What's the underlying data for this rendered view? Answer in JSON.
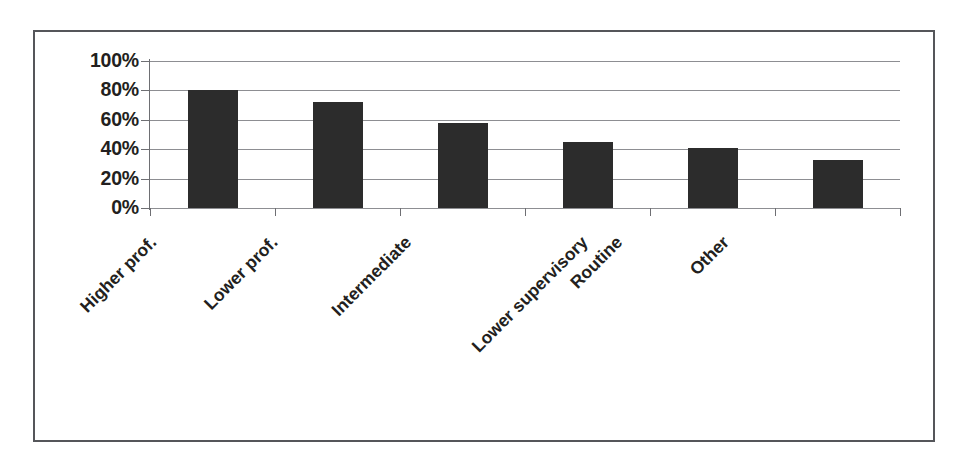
{
  "chart_data": {
    "type": "bar",
    "title": "",
    "subtitle": "",
    "xlabel": "",
    "ylabel": "",
    "categories": [
      "Higher prof.",
      "Lower prof.",
      "Intermediate",
      "Lower supervisory",
      "Routine",
      "Other"
    ],
    "values": [
      80,
      72,
      58,
      45,
      41,
      33
    ],
    "value_labels": [
      "80%",
      "72%",
      "58%",
      "45%",
      "41%",
      "33%"
    ],
    "ylim": [
      0,
      100
    ],
    "ytick_values": [
      0,
      20,
      40,
      60,
      80,
      100
    ],
    "ytick_labels": [
      "0%",
      "20%",
      "40%",
      "60%",
      "80%",
      "100%"
    ],
    "grid": true,
    "grid_axis": "y",
    "legend": false,
    "legend_position": "none",
    "xtick_label_rotation": -45,
    "series": [
      {
        "name": "",
        "values": [
          80,
          72,
          58,
          45,
          41,
          33
        ],
        "color": "#2c2c2c"
      }
    ],
    "colors": {
      "bar_fill": "#2c2c2c",
      "gridline": "#8d8e92",
      "axis_line": "#6e6f73",
      "frame_border": "#55565a",
      "text": "#231f20",
      "background": "#ffffff"
    }
  }
}
